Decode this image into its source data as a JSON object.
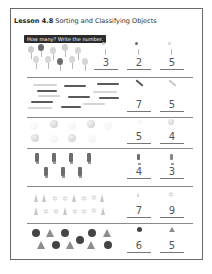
{
  "header": {
    "lesson_label": "Lesson 4.8",
    "lesson_title": "Sorting and Classifying Objects"
  },
  "instruction": "How many? Write the number.",
  "rows": [
    {
      "name": "balloons",
      "answers": [
        "3",
        "2",
        "5"
      ],
      "category_icons": [
        "light-balloon",
        "dark-balloon",
        "pale-balloon"
      ]
    },
    {
      "name": "pencils",
      "answers": [
        "7",
        "5"
      ],
      "category_icons": [
        "dark-pencil",
        "light-pencil"
      ]
    },
    {
      "name": "balls",
      "answers": [
        "5",
        "4"
      ],
      "category_icons": [
        "faint-ball",
        "shaded-ball"
      ]
    },
    {
      "name": "figures",
      "answers": [
        "4",
        "3"
      ],
      "category_icons": [
        "figure-a",
        "figure-b"
      ]
    },
    {
      "name": "leaves-and-flakes",
      "answers": [
        "7",
        "9"
      ],
      "category_icons": [
        "leaf",
        "flake"
      ]
    },
    {
      "name": "shapes",
      "answers": [
        "6",
        "5"
      ],
      "category_icons": [
        "circle",
        "triangle"
      ]
    }
  ],
  "colors": {
    "border": "#6a6a6a",
    "instruction_bg": "#2b2b2b",
    "answer_text": "#555555"
  }
}
